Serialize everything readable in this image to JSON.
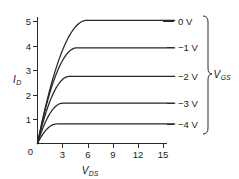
{
  "chart_data": {
    "type": "line",
    "title": "",
    "xlabel": "V_DS",
    "ylabel": "I_D",
    "xlabel_main": "V",
    "xlabel_sub": "DS",
    "ylabel_main": "I",
    "ylabel_sub": "D",
    "xlim": [
      0,
      16.4
    ],
    "ylim": [
      0,
      5.45
    ],
    "xticks": [
      0,
      3,
      6,
      9,
      12,
      15
    ],
    "xtick_labels": [
      "0",
      "3",
      "6",
      "9",
      "12",
      "15"
    ],
    "yticks": [
      0,
      1,
      2,
      3,
      4,
      5
    ],
    "ytick_labels": [
      "0",
      "1",
      "2",
      "3",
      "4",
      "5"
    ],
    "grid": false,
    "legend_position": "right",
    "group_label_main": "V",
    "group_label_sub": "GS",
    "group_label": "V_GS",
    "series": [
      {
        "name": "0 V",
        "label": "0 V",
        "saturation_current": 5.05,
        "knee_voltage": 5.9,
        "values": [
          0,
          2.45,
          3.95,
          4.62,
          4.88,
          4.99,
          5.03,
          5.05,
          5.05,
          5.05,
          5.05,
          5.05,
          5.05,
          5.05
        ]
      },
      {
        "name": "-1 V",
        "label": "−1 V",
        "saturation_current": 3.92,
        "knee_voltage": 4.7,
        "values": [
          0,
          2.1,
          3.25,
          3.7,
          3.86,
          3.91,
          3.92,
          3.92,
          3.92,
          3.92,
          3.92,
          3.92,
          3.92,
          3.92
        ]
      },
      {
        "name": "-2 V",
        "label": "−2 V",
        "saturation_current": 2.75,
        "knee_voltage": 3.8,
        "values": [
          0,
          1.62,
          2.38,
          2.65,
          2.73,
          2.75,
          2.75,
          2.75,
          2.75,
          2.75,
          2.75,
          2.75,
          2.75,
          2.75
        ]
      },
      {
        "name": "-3 V",
        "label": "−3 V",
        "saturation_current": 1.65,
        "knee_voltage": 3.0,
        "values": [
          0,
          1.06,
          1.48,
          1.62,
          1.65,
          1.65,
          1.65,
          1.65,
          1.65,
          1.65,
          1.65,
          1.65,
          1.65,
          1.65
        ]
      },
      {
        "name": "-4 V",
        "label": "−4 V",
        "saturation_current": 0.8,
        "knee_voltage": 2.3,
        "values": [
          0,
          0.5,
          0.69,
          0.77,
          0.79,
          0.8,
          0.8,
          0.8,
          0.8,
          0.8,
          0.8,
          0.8,
          0.8,
          0.8
        ]
      }
    ],
    "colors": {
      "curve": "#262626",
      "axis": "#2a2a2a",
      "text": "#1b1b1b",
      "background": "#ffffff"
    }
  }
}
